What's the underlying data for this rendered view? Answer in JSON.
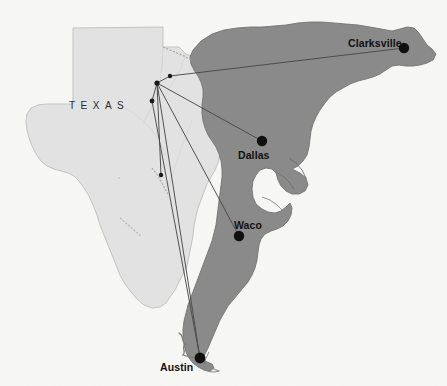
{
  "page": {
    "background_color": "#f7f7f5",
    "width": 447,
    "height": 386,
    "bleed_text_top": "p                                    the oil and pr",
    "bleed_text_second": "",
    "bleed_text_left": "",
    "bleed_text_right": ""
  },
  "map": {
    "title": "Texas network map",
    "state_label": "TEXAS",
    "base_state_fill": "#e2e2e2",
    "base_state_stroke": "#b9b9b9",
    "overlay_fill": "#8a8a8a",
    "overlay_stroke": "#6f6f6f",
    "line_color": "#4a4a4a",
    "node_color": "#111111",
    "cities": [
      {
        "name": "Clarksville",
        "label": "Clarksville",
        "dot_x": 404,
        "dot_y": 48,
        "label_x": 348,
        "label_y": 37,
        "dot_r": 5.2
      },
      {
        "name": "Dallas",
        "label": "Dallas",
        "dot_x": 262,
        "dot_y": 141,
        "label_x": 238,
        "label_y": 149,
        "dot_r": 5.2
      },
      {
        "name": "Waco",
        "label": "Waco",
        "dot_x": 239,
        "dot_y": 236,
        "label_x": 234,
        "label_y": 219,
        "dot_r": 5.2
      },
      {
        "name": "Austin",
        "label": "Austin",
        "dot_x": 200,
        "dot_y": 358,
        "label_x": 160,
        "label_y": 361,
        "dot_r": 5.2
      }
    ],
    "hub_nodes": [
      {
        "name": "hub-north",
        "x": 170,
        "y": 76,
        "r": 2.2
      },
      {
        "name": "hub-main",
        "x": 157,
        "y": 83,
        "r": 2.6
      },
      {
        "name": "hub-west",
        "x": 152,
        "y": 101,
        "r": 2.4
      },
      {
        "name": "hub-south",
        "x": 161,
        "y": 175,
        "r": 2.2
      }
    ],
    "connections": [
      {
        "from": "hub-north",
        "to": "Clarksville"
      },
      {
        "from": "hub-main",
        "to": "Dallas"
      },
      {
        "from": "hub-main",
        "to": "Waco"
      },
      {
        "from": "hub-main",
        "to": "Austin"
      },
      {
        "from": "hub-west",
        "to": "Austin"
      },
      {
        "from": "hub-main",
        "to": "hub-south"
      },
      {
        "from": "hub-main",
        "to": "hub-west"
      }
    ]
  }
}
